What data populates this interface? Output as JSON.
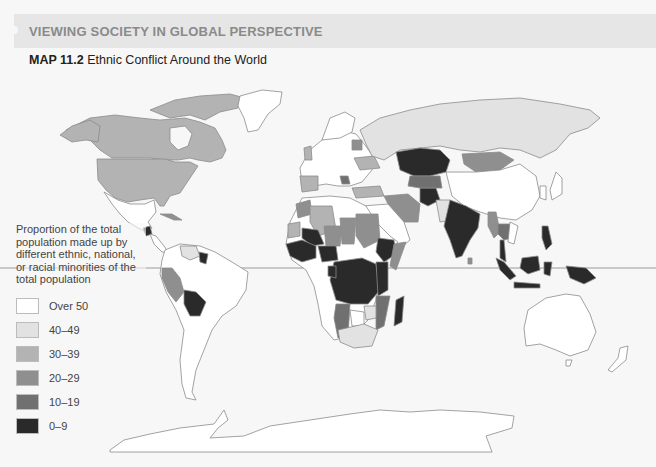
{
  "header": {
    "section_title": "VIEWING SOCIETY IN GLOBAL PERSPECTIVE",
    "map_number": "MAP 11.2",
    "map_title": "Ethnic Conflict Around the World"
  },
  "legend": {
    "title": "Proportion of the total population made up by different ethnic, national, or racial minorities of the total population",
    "items": [
      {
        "label": "Over 50",
        "color": "#ffffff"
      },
      {
        "label": "40–49",
        "color": "#e2e2e2"
      },
      {
        "label": "30–39",
        "color": "#b3b3b3"
      },
      {
        "label": "20–29",
        "color": "#8f8f8f"
      },
      {
        "label": "10–19",
        "color": "#707070"
      },
      {
        "label": "0–9",
        "color": "#2a2a2a"
      }
    ]
  },
  "colors": {
    "background": "#f7f7f7",
    "header_bar": "#e6e6e6",
    "border": "#8c8c8c",
    "equator": "#9a9a9a"
  },
  "map": {
    "features": [
      "equator-line",
      "north-america",
      "south-america",
      "europe",
      "africa",
      "asia",
      "australia",
      "antarctica",
      "greenland"
    ]
  }
}
